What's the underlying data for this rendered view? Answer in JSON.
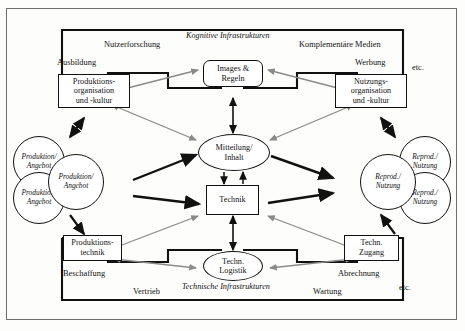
{
  "diagram": {
    "title_regions": {
      "cognitive": "Kognitive Infrastrukturen",
      "technical": "Technische Infrastrukturen"
    },
    "top_labels": {
      "nutzerforschung": "Nutzerforschung",
      "komplementaere": "Komplementäre Medien",
      "ausbildung": "Ausbildung",
      "werbung": "Werbung",
      "etc_top": "etc."
    },
    "bottom_labels": {
      "beschaffung": "Beschaffung",
      "vertrieb": "Vertrieb",
      "wartung": "Wartung",
      "abrechnung": "Abrechnung",
      "etc_bottom": "etc."
    },
    "nodes": {
      "prod_org": {
        "line1": "Produktions-",
        "line2": "organisation",
        "line3": "und -kultur"
      },
      "nutz_org": {
        "line1": "Nutzungs-",
        "line2": "organisation",
        "line3": "und -kultur"
      },
      "images_regeln": {
        "line1": "Images &",
        "line2": "Regeln"
      },
      "mitteilung": {
        "line1": "Mitteilung/",
        "line2": "Inhalt"
      },
      "technik": {
        "line1": "Technik"
      },
      "prod_technik": {
        "line1": "Produktions-",
        "line2": "technik"
      },
      "techn_zugang": {
        "line1": "Techn.",
        "line2": "Zugang"
      },
      "techn_logistik": {
        "line1": "Techn.",
        "line2": "Logistik"
      }
    },
    "circles_left": [
      {
        "line1": "Produktion/",
        "line2": "Angebot"
      },
      {
        "line1": "Produktion/",
        "line2": "Angebot"
      },
      {
        "line1": "Produktion/",
        "line2": "Angebot"
      }
    ],
    "circles_right": [
      {
        "line1": "Reprod./",
        "line2": "Nutzung"
      },
      {
        "line1": "Reprod./",
        "line2": "Nutzung"
      },
      {
        "line1": "Reprod./",
        "line2": "Nutzung"
      }
    ],
    "colors": {
      "ink": "#111111",
      "gray_arrow": "#8a8a8a",
      "border": "#6f6f6f",
      "page": "#fdfdfb"
    }
  }
}
